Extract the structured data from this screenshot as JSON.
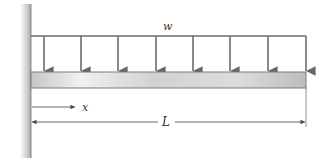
{
  "diagram": {
    "labels": {
      "load": "w",
      "position": "x",
      "length": "L"
    },
    "load_arrows": {
      "count": 8,
      "x_positions": [
        44,
        81,
        118,
        156,
        193,
        230,
        268,
        306
      ]
    },
    "colors": {
      "line": "#6b6b6b",
      "wall_light": "#f2f2f2",
      "wall_dark": "#a8a8a8",
      "beam_light": "#ededed",
      "beam_dark": "#bdbdbd",
      "text": "#333333"
    }
  }
}
